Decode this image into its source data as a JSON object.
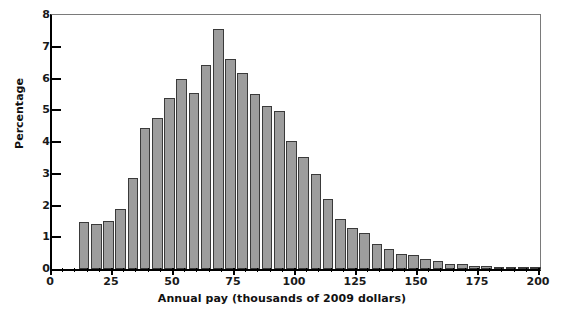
{
  "chart_data": {
    "type": "bar",
    "title": "",
    "xlabel": "Annual pay (thousands of 2009 dollars)",
    "ylabel": "Percentage",
    "xlim": [
      0,
      200
    ],
    "ylim": [
      0,
      8
    ],
    "grid": false,
    "legend": null,
    "bin_width": 5,
    "x_major_ticks": [
      0,
      25,
      50,
      75,
      100,
      125,
      150,
      175,
      200
    ],
    "x_major_tick_labels": [
      "0",
      "25",
      "50",
      "75",
      "100",
      "125",
      "150",
      "175",
      "200"
    ],
    "x_minor_tick_step": 5,
    "y_ticks": [
      0,
      1,
      2,
      3,
      4,
      5,
      6,
      7,
      8
    ],
    "y_tick_labels": [
      "0",
      "1",
      "2",
      "3",
      "4",
      "5",
      "6",
      "7",
      "8"
    ],
    "bar_fill_color": "#9d9d9d",
    "bar_edge_color": "#3a3a3a",
    "bin_starts": [
      11,
      16,
      21,
      26,
      31,
      36,
      41,
      46,
      51,
      56,
      61,
      66,
      71,
      76,
      81,
      86,
      91,
      96,
      101,
      106,
      111,
      116,
      121,
      126,
      131,
      136,
      141,
      146,
      151,
      156,
      161,
      166,
      171,
      176,
      181,
      186,
      191,
      196
    ],
    "categories": [
      "11-16",
      "16-21",
      "21-26",
      "26-31",
      "31-36",
      "36-41",
      "41-46",
      "46-51",
      "51-56",
      "56-61",
      "61-66",
      "66-71",
      "71-76",
      "76-81",
      "81-86",
      "86-91",
      "91-96",
      "96-101",
      "101-106",
      "106-111",
      "111-116",
      "116-121",
      "121-126",
      "126-131",
      "131-136",
      "136-141",
      "141-146",
      "146-151",
      "151-156",
      "156-161",
      "161-166",
      "166-171",
      "171-176",
      "176-181",
      "181-186",
      "186-191",
      "191-196",
      "196-201"
    ],
    "values": [
      1.48,
      1.42,
      1.52,
      1.9,
      2.88,
      4.44,
      4.76,
      5.38,
      6.0,
      5.55,
      6.42,
      7.55,
      6.6,
      6.18,
      5.5,
      5.12,
      4.98,
      4.02,
      3.52,
      3.0,
      2.22,
      1.58,
      1.3,
      1.12,
      0.78,
      0.62,
      0.48,
      0.45,
      0.32,
      0.25,
      0.16,
      0.15,
      0.1,
      0.08,
      0.07,
      0.06,
      0.06,
      0.05
    ]
  },
  "axes": {
    "x_title": "Annual pay (thousands of 2009 dollars)",
    "y_title": "Percentage"
  }
}
